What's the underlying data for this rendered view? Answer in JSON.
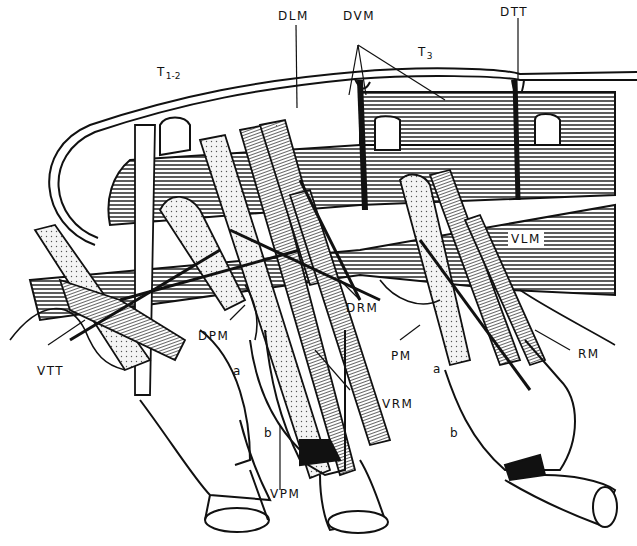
{
  "figure": {
    "colors": {
      "ink": "#111111",
      "background": "#ffffff",
      "hatch": "#333333"
    }
  },
  "labels": {
    "t12": {
      "main": "T",
      "sub": "1-2"
    },
    "t3": {
      "main": "T",
      "sub": "3"
    },
    "dlm": "DLM",
    "dvm": "DVM",
    "dtt": "DTT",
    "vlm": "VLM",
    "drm": "DRM",
    "dpm": "DPM",
    "vtt": "VTT",
    "pm": "PM",
    "rm": "RM",
    "vrm": "VRM",
    "vpm": "VPM",
    "a_left": "a",
    "b_left": "b",
    "a_right": "a",
    "b_right": "b"
  }
}
